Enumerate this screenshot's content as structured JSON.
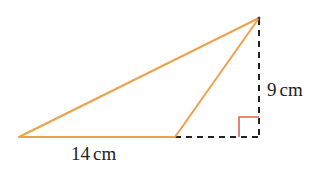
{
  "diagram": {
    "type": "geometry-triangle",
    "colors": {
      "triangle_stroke": "#f0a04b",
      "dashed_stroke": "#222222",
      "right_angle_marker": "#e8604c",
      "text": "#222222",
      "background": "#ffffff"
    },
    "vertices": {
      "left": [
        19,
        137
      ],
      "base_right": [
        175,
        137
      ],
      "apex": [
        259,
        18
      ],
      "foot": [
        259,
        137
      ]
    },
    "labels": {
      "base": {
        "value": "14",
        "unit": "cm"
      },
      "height": {
        "value": "9",
        "unit": "cm"
      }
    },
    "right_angle_marker": {
      "size": 20
    }
  }
}
